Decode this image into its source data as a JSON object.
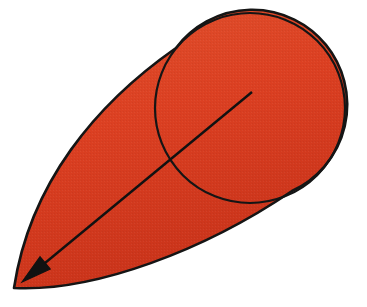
{
  "figure": {
    "canvas": {
      "width": 367,
      "height": 307,
      "background_color": "#ffffff"
    },
    "colors": {
      "fill_red": "#DC4022",
      "fill_red_light": "#E0522E",
      "fill_red_dark": "#C9331A",
      "outline_black": "#151515",
      "arrow_black": "#111111"
    },
    "shapes": {
      "circle": {
        "name": "circle",
        "center_x": 250,
        "center_y": 108,
        "radius": 95,
        "stroke_width": 2.2
      },
      "cone": {
        "name": "cone-body",
        "apex_x": 14,
        "apex_y": 288,
        "upper_tangent_x": 176,
        "upper_tangent_y": 48,
        "lower_tangent_x": 292,
        "lower_tangent_y": 191,
        "stroke_width": 2.6
      },
      "arrow": {
        "name": "radius-arrow",
        "tail_x": 252,
        "tail_y": 92,
        "tip_x": 22,
        "tip_y": 282,
        "stroke_width": 2.4,
        "head_length": 30,
        "head_width": 16
      }
    },
    "labels": {
      "shape_label": "",
      "caption": ""
    }
  }
}
